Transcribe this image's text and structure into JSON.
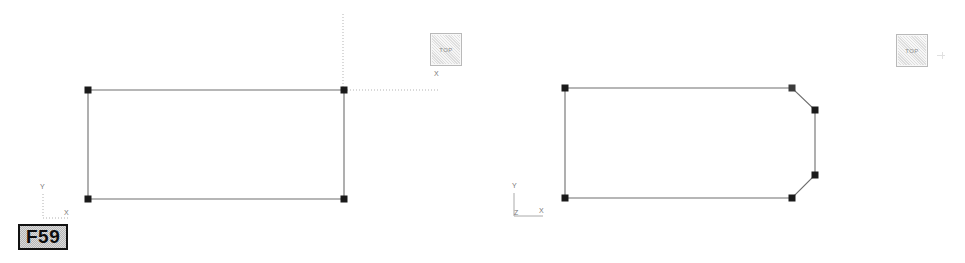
{
  "app": {
    "background_color": "#ffffff",
    "line_color": "#6e6e6e",
    "handle_color": "#1a1a1a",
    "guide_color": "#b0b0b0",
    "axis_label_color": "#777777"
  },
  "panels": [
    {
      "id": "left",
      "name": "left-viewport",
      "view_button": {
        "label": "TOP",
        "name": "view-cube-top-button"
      },
      "tag": {
        "label": "F59",
        "name": "frame-label-f59"
      },
      "axis_indicator": {
        "name": "axis-indicator-left",
        "labels": [
          {
            "text": "Y",
            "x": 43,
            "y": 188
          },
          {
            "text": "X",
            "x": 66,
            "y": 213
          }
        ]
      },
      "canvas_axis_labels": [
        {
          "text": "X",
          "x": 436,
          "y": 74
        }
      ],
      "shape": {
        "name": "rectangle-profile",
        "type": "polyline",
        "closed": true,
        "points": [
          [
            88,
            90
          ],
          [
            344,
            90
          ],
          [
            344,
            199
          ],
          [
            88,
            199
          ]
        ],
        "handles": [
          [
            88,
            90
          ],
          [
            344,
            90
          ],
          [
            344,
            199
          ],
          [
            88,
            199
          ]
        ]
      },
      "guides": [
        {
          "name": "guide-vertical",
          "x1": 343,
          "y1": 14,
          "x2": 343,
          "y2": 90
        },
        {
          "name": "guide-horizontal",
          "x1": 344,
          "y1": 90,
          "x2": 440,
          "y2": 90
        },
        {
          "name": "guide-axis-vertical",
          "x1": 43,
          "y1": 194,
          "x2": 43,
          "y2": 218
        },
        {
          "name": "guide-axis-horizontal",
          "x1": 43,
          "y1": 218,
          "x2": 68,
          "y2": 218
        }
      ]
    },
    {
      "id": "right",
      "name": "right-viewport",
      "view_button": {
        "label": "TOP",
        "name": "view-cube-top-button"
      },
      "axis_indicator": {
        "name": "axis-indicator-right",
        "labels": [
          {
            "text": "Y",
            "x": 514,
            "y": 187
          },
          {
            "text": "Z",
            "x": 516,
            "y": 214
          },
          {
            "text": "X",
            "x": 541,
            "y": 212
          }
        ]
      },
      "shape": {
        "name": "chamfered-profile",
        "type": "polyline",
        "closed": true,
        "points": [
          [
            565,
            88
          ],
          [
            792,
            88
          ],
          [
            815,
            110
          ],
          [
            815,
            175
          ],
          [
            792,
            198
          ],
          [
            565,
            198
          ]
        ],
        "handles": [
          [
            565,
            88
          ],
          [
            792,
            88
          ],
          [
            815,
            110
          ],
          [
            815,
            175
          ],
          [
            792,
            198
          ],
          [
            565,
            198
          ]
        ]
      },
      "guides": [
        {
          "name": "guide-axis-vertical",
          "x1": 514,
          "y1": 193,
          "x2": 514,
          "y2": 216
        },
        {
          "name": "guide-axis-horizontal",
          "x1": 514,
          "y1": 216,
          "x2": 543,
          "y2": 216
        }
      ]
    }
  ]
}
